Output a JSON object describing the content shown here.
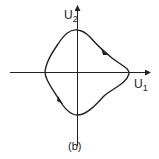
{
  "figure": {
    "label": "(b)",
    "axes": {
      "x_label_main": "U",
      "x_label_sub": "1",
      "y_label_main": "U",
      "y_label_sub": "2"
    },
    "curve": {
      "description": "closed phase-plane trajectory (limit cycle)",
      "direction": "clockwise",
      "arrow_count": 2
    },
    "colors": {
      "ink": "#222222",
      "background": "#ffffff"
    }
  }
}
